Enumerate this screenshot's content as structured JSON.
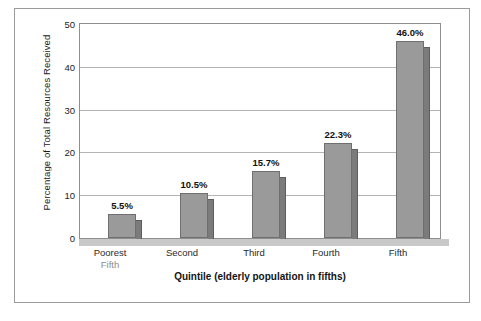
{
  "chart_data": {
    "type": "bar",
    "title": "",
    "xlabel": "Quintile (elderly population in fifths)",
    "ylabel": "Percentage of Total Resources Received",
    "categories": [
      "Poorest Fifth",
      "Second",
      "Third",
      "Fourth",
      "Fifth"
    ],
    "category_lines": [
      [
        "Poorest",
        "Fifth"
      ],
      [
        "Second",
        ""
      ],
      [
        "Third",
        ""
      ],
      [
        "Fourth",
        ""
      ],
      [
        "Fifth",
        ""
      ]
    ],
    "values": [
      5.5,
      10.5,
      15.7,
      22.3,
      46.0
    ],
    "value_labels": [
      "5.5%",
      "10.5%",
      "15.7%",
      "22.3%",
      "46.0%"
    ],
    "ylim": [
      0,
      50
    ],
    "yticks": [
      0,
      10,
      20,
      30,
      40,
      50
    ],
    "ytick_labels": [
      "0",
      "10",
      "20",
      "30",
      "40",
      "50"
    ],
    "grid": true,
    "legend": "none",
    "colors": {
      "bar_face": "#9a9a9a",
      "bar_side": "#7b7b7b",
      "bar_outline": "#6f6f6f",
      "gridline": "#b4b4b4",
      "axis": "#8e8e8e",
      "floor": "#c9c9c9",
      "frame": "#9b9b9b",
      "text": "#1a1a1a",
      "background": "#ffffff"
    }
  }
}
